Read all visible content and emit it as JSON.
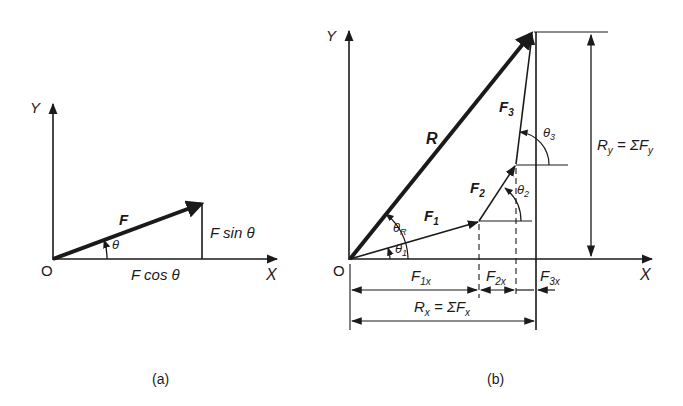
{
  "figure_a": {
    "caption": "(a)",
    "axis_y": "Y",
    "axis_x": "X",
    "origin": "O",
    "vector": "F",
    "angle": "θ",
    "component_x": "F cos θ",
    "component_y": "F sin θ"
  },
  "figure_b": {
    "caption": "(b)",
    "axis_y": "Y",
    "axis_x": "X",
    "origin": "O",
    "resultant": "R",
    "forces": [
      {
        "name": "F",
        "sub": "1",
        "angle": "θ",
        "angle_sub": "1"
      },
      {
        "name": "F",
        "sub": "2",
        "angle": "θ",
        "angle_sub": "2"
      },
      {
        "name": "F",
        "sub": "3",
        "angle": "θ",
        "angle_sub": "3"
      }
    ],
    "resultant_angle": {
      "sym": "θ",
      "sub": "R"
    },
    "x_components": [
      {
        "name": "F",
        "sub": "1x"
      },
      {
        "name": "F",
        "sub": "2x"
      },
      {
        "name": "F",
        "sub": "3x"
      }
    ],
    "rx_label": {
      "lhs": "R",
      "lhs_sub": "x",
      "eq": " = ΣF",
      "rhs_sub": "x"
    },
    "ry_label": {
      "lhs": "R",
      "lhs_sub": "y",
      "eq": " = ΣF",
      "rhs_sub": "y"
    }
  },
  "colors": {
    "ink": "#1a1a1a",
    "background": "#ffffff"
  }
}
